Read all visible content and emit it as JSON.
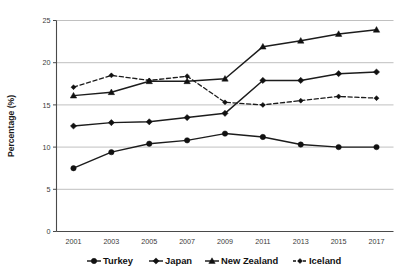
{
  "chart_data": {
    "type": "line",
    "title": "",
    "xlabel": "",
    "ylabel": "Percentage (%)",
    "x": [
      2001,
      2003,
      2005,
      2007,
      2009,
      2011,
      2013,
      2015,
      2017
    ],
    "xtick_labels": [
      "2001",
      "2003",
      "2005",
      "2007",
      "2009",
      "2011",
      "2013",
      "2015",
      "2017"
    ],
    "ytick_labels": [
      "0",
      "5",
      "10",
      "15",
      "20",
      "25"
    ],
    "yticks": [
      0,
      5,
      10,
      15,
      20,
      25
    ],
    "ylim": [
      0,
      25
    ],
    "grid": "horizontal",
    "legend_position": "bottom",
    "series": [
      {
        "name": "Turkey",
        "marker": "circle",
        "linestyle": "solid",
        "color": "#111111",
        "values": [
          7.5,
          9.4,
          10.4,
          10.8,
          11.6,
          11.2,
          10.3,
          10.0,
          10.0
        ]
      },
      {
        "name": "Japan",
        "marker": "diamond",
        "linestyle": "solid",
        "color": "#111111",
        "values": [
          12.5,
          12.9,
          13.0,
          13.5,
          14.0,
          17.9,
          17.9,
          18.7,
          18.9
        ]
      },
      {
        "name": "New Zealand",
        "marker": "triangle",
        "linestyle": "solid",
        "color": "#111111",
        "values": [
          16.1,
          16.5,
          17.8,
          17.8,
          18.1,
          21.9,
          22.6,
          23.4,
          23.9
        ]
      },
      {
        "name": "Iceland",
        "marker": "diamond-small",
        "linestyle": "dashed",
        "color": "#111111",
        "values": [
          17.1,
          18.5,
          17.9,
          18.4,
          15.3,
          15.0,
          15.5,
          16.0,
          15.8
        ]
      }
    ],
    "secondary_series": [
      {
        "name": "Turkey-overlap",
        "note": "Turkey and Japan run close together 2005-2009",
        "values": [
          7.5,
          9.4,
          10.4,
          10.8,
          11.6
        ]
      }
    ]
  },
  "legend": {
    "items": [
      {
        "label": "Turkey",
        "marker": "circle",
        "linestyle": "solid"
      },
      {
        "label": "Japan",
        "marker": "diamond",
        "linestyle": "solid"
      },
      {
        "label": "New Zealand",
        "marker": "triangle",
        "linestyle": "solid"
      },
      {
        "label": "Iceland",
        "marker": "diamond-small",
        "linestyle": "dashed"
      }
    ]
  }
}
